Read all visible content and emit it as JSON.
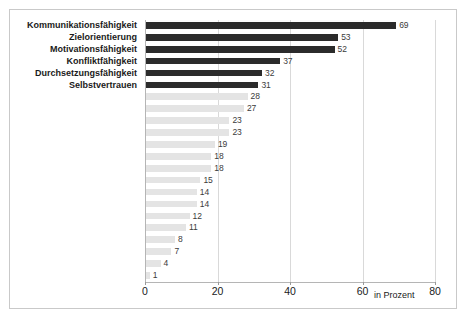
{
  "chart_data": {
    "type": "bar",
    "orientation": "horizontal",
    "title": "",
    "subtitle": "",
    "xlabel": "in Prozent",
    "ylabel": "",
    "xlim": [
      0,
      80
    ],
    "xticks": [
      0,
      20,
      40,
      60,
      80
    ],
    "xtick_labels": [
      "0",
      "20",
      "40",
      "60",
      "80"
    ],
    "grid": true,
    "grid_axis": "x",
    "legend": false,
    "colors": {
      "highlight_bar": "#2b2b2b",
      "other_bar": "#e4e4e4",
      "gridline": "#d9d9d9",
      "axis": "#b5b5b5",
      "frame": "#c9c9c9",
      "text": "#1a1a1a",
      "value_text": "#3b3b3b",
      "background": "#ffffff"
    },
    "categories": [
      "Kommunikationsfähigkeit",
      "Zielorientierung",
      "Motivationsfähigkeit",
      "Konfliktfähigkeit",
      "Durchsetzungsfähigkeit",
      "Selbstvertrauen",
      "",
      "",
      "",
      "",
      "",
      "",
      "",
      "",
      "",
      "",
      "",
      ""
    ],
    "values": [
      69,
      53,
      52,
      37,
      32,
      31,
      28,
      27,
      23,
      23,
      19,
      18,
      18,
      15,
      14,
      14,
      12,
      11
    ],
    "bars": [
      {
        "label": "Kommunikationsfähigkeit",
        "value": 69,
        "value_label": "69",
        "highlight": true
      },
      {
        "label": "Zielorientierung",
        "value": 53,
        "value_label": "53",
        "highlight": true
      },
      {
        "label": "Motivationsfähigkeit",
        "value": 52,
        "value_label": "52",
        "highlight": true
      },
      {
        "label": "Konfliktfähigkeit",
        "value": 37,
        "value_label": "37",
        "highlight": true
      },
      {
        "label": "Durchsetzungsfähigkeit",
        "value": 32,
        "value_label": "32",
        "highlight": true
      },
      {
        "label": "Selbstvertrauen",
        "value": 31,
        "value_label": "31",
        "highlight": true
      },
      {
        "label": "",
        "value": 28,
        "value_label": "28",
        "highlight": false
      },
      {
        "label": "",
        "value": 27,
        "value_label": "27",
        "highlight": false
      },
      {
        "label": "",
        "value": 23,
        "value_label": "23",
        "highlight": false
      },
      {
        "label": "",
        "value": 23,
        "value_label": "23",
        "highlight": false
      },
      {
        "label": "",
        "value": 19,
        "value_label": "19",
        "highlight": false
      },
      {
        "label": "",
        "value": 18,
        "value_label": "18",
        "highlight": false
      },
      {
        "label": "",
        "value": 18,
        "value_label": "18",
        "highlight": false
      },
      {
        "label": "",
        "value": 15,
        "value_label": "15",
        "highlight": false
      },
      {
        "label": "",
        "value": 14,
        "value_label": "14",
        "highlight": false
      },
      {
        "label": "",
        "value": 14,
        "value_label": "14",
        "highlight": false
      },
      {
        "label": "",
        "value": 12,
        "value_label": "12",
        "highlight": false
      },
      {
        "label": "",
        "value": 11,
        "value_label": "11",
        "highlight": false
      },
      {
        "label": "",
        "value": 8,
        "value_label": "8",
        "highlight": false
      },
      {
        "label": "",
        "value": 7,
        "value_label": "7",
        "highlight": false
      },
      {
        "label": "",
        "value": 4,
        "value_label": "4",
        "highlight": false
      },
      {
        "label": "",
        "value": 1,
        "value_label": "1",
        "highlight": false
      }
    ]
  }
}
